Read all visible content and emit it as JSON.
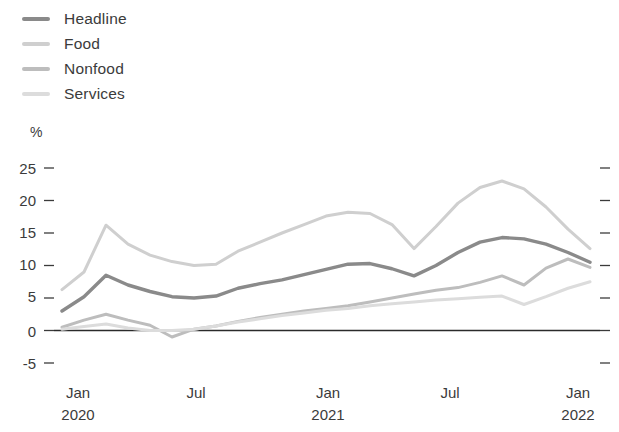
{
  "legend": {
    "items": [
      {
        "label": "Headline",
        "color": "#8a8a8a"
      },
      {
        "label": "Food",
        "color": "#cfcfcf"
      },
      {
        "label": "Nonfood",
        "color": "#bdbdbd"
      },
      {
        "label": "Services",
        "color": "#dcdcdc"
      }
    ]
  },
  "axes": {
    "y_unit": "%",
    "y_ticks": [
      "25",
      "20",
      "15",
      "10",
      "5",
      "0",
      "-5"
    ],
    "x_ticks": [
      {
        "label": "Jan",
        "sub": "2020"
      },
      {
        "label": "Jul",
        "sub": ""
      },
      {
        "label": "Jan",
        "sub": "2021"
      },
      {
        "label": "Jul",
        "sub": ""
      },
      {
        "label": "Jan",
        "sub": "2022"
      }
    ]
  },
  "chart_data": {
    "type": "line",
    "title": "",
    "xlabel": "",
    "ylabel": "%",
    "ylim": [
      -5,
      25
    ],
    "grid": false,
    "legend_position": "top-left",
    "zero_line": true,
    "x": [
      "Jan 2020",
      "Feb 2020",
      "Mar 2020",
      "Apr 2020",
      "May 2020",
      "Jun 2020",
      "Jul 2020",
      "Aug 2020",
      "Sep 2020",
      "Oct 2020",
      "Nov 2020",
      "Dec 2020",
      "Jan 2021",
      "Feb 2021",
      "Mar 2021",
      "Apr 2021",
      "May 2021",
      "Jun 2021",
      "Jul 2021",
      "Aug 2021",
      "Sep 2021",
      "Oct 2021",
      "Nov 2021",
      "Dec 2021",
      "Jan 2022"
    ],
    "series": [
      {
        "name": "Headline",
        "color": "#8a8a8a",
        "width": 3.4,
        "values": [
          3.0,
          5.2,
          8.5,
          7.0,
          6.0,
          5.2,
          5.0,
          5.3,
          6.5,
          7.2,
          7.8,
          8.6,
          9.4,
          10.2,
          10.3,
          9.5,
          8.4,
          10.0,
          12.0,
          13.6,
          14.3,
          14.1,
          13.3,
          12.0,
          10.5
        ]
      },
      {
        "name": "Food",
        "color": "#cfcfcf",
        "width": 3.0,
        "values": [
          6.3,
          9.0,
          16.2,
          13.3,
          11.6,
          10.6,
          10.0,
          10.2,
          12.2,
          13.6,
          15.0,
          16.3,
          17.6,
          18.2,
          18.0,
          16.3,
          12.6,
          16.0,
          19.6,
          22.0,
          23.0,
          21.8,
          19.0,
          15.6,
          12.6
        ]
      },
      {
        "name": "Nonfood",
        "color": "#bdbdbd",
        "width": 3.0,
        "values": [
          0.5,
          1.6,
          2.5,
          1.6,
          0.8,
          -1.0,
          0.2,
          0.7,
          1.4,
          2.0,
          2.5,
          3.0,
          3.4,
          3.8,
          4.4,
          5.0,
          5.6,
          6.2,
          6.6,
          7.4,
          8.4,
          7.0,
          9.6,
          11.0,
          9.7
        ]
      },
      {
        "name": "Services",
        "color": "#dcdcdc",
        "width": 3.0,
        "values": [
          0.2,
          0.6,
          1.0,
          0.4,
          0.0,
          0.0,
          0.2,
          0.7,
          1.3,
          1.8,
          2.3,
          2.7,
          3.1,
          3.4,
          3.8,
          4.1,
          4.4,
          4.7,
          4.9,
          5.1,
          5.3,
          4.0,
          5.2,
          6.5,
          7.5
        ]
      }
    ]
  }
}
